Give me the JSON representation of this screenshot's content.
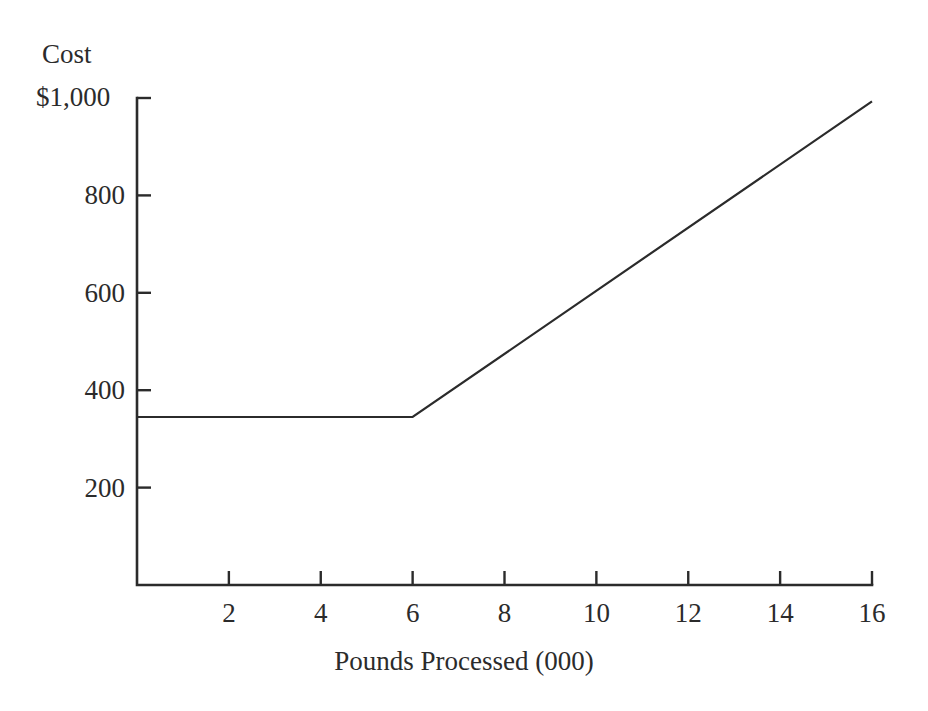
{
  "chart_data": {
    "type": "line",
    "title": "",
    "xlabel": "Pounds Processed (000)",
    "ylabel": "Cost",
    "y_axis_top_label": "$1,000",
    "y_unit_prefix": "$",
    "xlim": [
      0,
      16
    ],
    "ylim": [
      0,
      1000
    ],
    "grid": false,
    "legend": null,
    "x_ticks": [
      {
        "value": 2,
        "label": "2"
      },
      {
        "value": 4,
        "label": "4"
      },
      {
        "value": 6,
        "label": "6"
      },
      {
        "value": 8,
        "label": "8"
      },
      {
        "value": 10,
        "label": "10"
      },
      {
        "value": 12,
        "label": "12"
      },
      {
        "value": 14,
        "label": "14"
      },
      {
        "value": 16,
        "label": "16"
      }
    ],
    "y_ticks": [
      {
        "value": 1000,
        "label": "$1,000"
      },
      {
        "value": 800,
        "label": "800"
      },
      {
        "value": 600,
        "label": "600"
      },
      {
        "value": 400,
        "label": "400"
      },
      {
        "value": 200,
        "label": "200"
      }
    ],
    "series": [
      {
        "name": "Mixed cost",
        "color": "#2b2b2b",
        "points": [
          {
            "x": 0,
            "y": 345
          },
          {
            "x": 6,
            "y": 345
          },
          {
            "x": 16,
            "y": 993
          }
        ]
      }
    ],
    "annotations": []
  },
  "axes": {
    "x_axis_name": "x-axis",
    "y_axis_name": "y-axis"
  }
}
